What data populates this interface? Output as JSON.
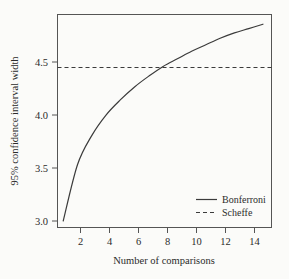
{
  "chart_data": {
    "type": "line",
    "title": "",
    "xlabel": "Number of comparisons",
    "ylabel": "95% confidence interval width",
    "xlim": [
      0.6,
      15.6
    ],
    "ylim": [
      2.95,
      4.92
    ],
    "xticks": [
      2,
      4,
      6,
      8,
      10,
      12,
      14
    ],
    "xticklabels": [
      "2",
      "4",
      "6",
      "8",
      "10",
      "12",
      "14"
    ],
    "yticks": [
      3.0,
      3.5,
      4.0,
      4.5
    ],
    "yticklabels": [
      "3.0",
      "3.5",
      "4.0",
      "4.5"
    ],
    "grid": false,
    "legend_position": "lower right",
    "x": [
      1,
      2,
      3,
      4,
      5,
      6,
      7,
      8,
      9,
      10,
      11,
      12,
      13,
      14,
      15
    ],
    "series": [
      {
        "name": "Bonferroni",
        "style": "solid",
        "color": "#3b3b3b",
        "values": [
          3.01,
          3.53,
          3.8,
          3.99,
          4.13,
          4.25,
          4.35,
          4.44,
          4.51,
          4.58,
          4.64,
          4.7,
          4.75,
          4.79,
          4.83
        ]
      },
      {
        "name": "Scheffe",
        "style": "dashed",
        "color": "#3b3b3b",
        "constant": 4.43,
        "values": [
          4.43,
          4.43,
          4.43,
          4.43,
          4.43,
          4.43,
          4.43,
          4.43,
          4.43,
          4.43,
          4.43,
          4.43,
          4.43,
          4.43,
          4.43
        ]
      }
    ],
    "annotations": [
      {
        "text": "crossing near n = 7.6",
        "x": 7.6,
        "y": 4.43
      }
    ]
  },
  "axes": {
    "x_title": "Number of comparisons",
    "y_title": "95% confidence interval width",
    "x_tick_0": "2",
    "x_tick_1": "4",
    "x_tick_2": "6",
    "x_tick_3": "8",
    "x_tick_4": "10",
    "x_tick_5": "12",
    "x_tick_6": "14",
    "y_tick_0": "3.0",
    "y_tick_1": "3.5",
    "y_tick_2": "4.0",
    "y_tick_3": "4.5"
  },
  "legend": {
    "entry_0": "Bonferroni",
    "entry_1": "Scheffe"
  },
  "colors": {
    "background": "#fbfbf9",
    "line": "#3b3b3b",
    "frame": "#555555",
    "text": "#2b2b2b"
  }
}
